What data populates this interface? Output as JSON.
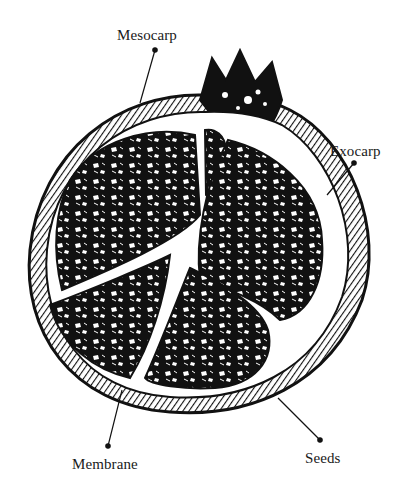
{
  "diagram": {
    "style": "black and white woodcut illustration",
    "colors": {
      "ink": "#111111",
      "paper": "#ffffff"
    },
    "labels": [
      {
        "id": "mesocarp",
        "text": "Mesocarp",
        "anchor": [
          155,
          50
        ],
        "target": [
          140,
          103
        ]
      },
      {
        "id": "exocarp",
        "text": "Exocarp",
        "anchor": [
          354,
          163
        ],
        "target": [
          327,
          195
        ]
      },
      {
        "id": "membrane",
        "text": "Membrane",
        "anchor": [
          108,
          446
        ],
        "target": [
          122,
          390
        ]
      },
      {
        "id": "seeds",
        "text": "Seeds",
        "anchor": [
          320,
          440
        ],
        "target": [
          278,
          398
        ]
      }
    ]
  }
}
